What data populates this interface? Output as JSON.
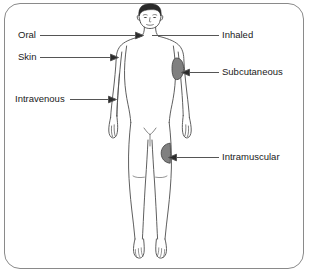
{
  "diagram": {
    "frame": {
      "border_color": "#8a8a8a",
      "background": "#ffffff"
    },
    "body_outline_color": "#4d4d4d",
    "patch_fill_color": "#808080",
    "leader_line_color": "#555555",
    "text_color": "#1a1a1a",
    "labels": {
      "oral": "Oral",
      "skin": "Skin",
      "intravenous": "Intravenous",
      "inhaled": "Inhaled",
      "subcutaneous": "Subcutaneous",
      "intramuscular": "Intramuscular"
    },
    "icon_names": {
      "oral": "arrow-to-mouth-icon",
      "skin": "arrow-to-shoulder-icon",
      "intravenous": "arrow-to-forearm-vein-icon",
      "inhaled": "line-to-nose-icon",
      "subcutaneous": "arrow-to-upper-arm-patch-icon",
      "intramuscular": "arrow-to-thigh-patch-icon"
    }
  }
}
